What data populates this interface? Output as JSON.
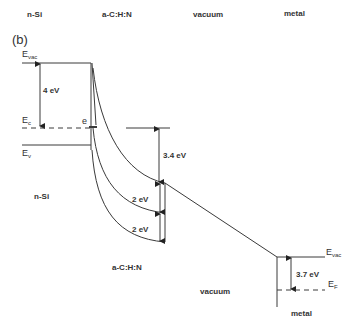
{
  "panel_label": "(b)",
  "regions": {
    "header": [
      "n-Si",
      "a-C:H:N",
      "vacuum",
      "metal"
    ],
    "body": {
      "nsi": "n-Si",
      "acn": "a-C:H:N",
      "vacuum": "vacuum",
      "metal": "metal"
    }
  },
  "levels": {
    "evac_left": {
      "main": "E",
      "sub": "vac"
    },
    "ec": {
      "main": "E",
      "sub": "c"
    },
    "ev": {
      "main": "E",
      "sub": "v"
    },
    "evac_right": {
      "main": "E",
      "sub": "vac"
    },
    "ef": {
      "main": "E",
      "sub": "F"
    }
  },
  "electron_label": "e",
  "energies": {
    "nsi_affinity": "4 eV",
    "acn_offset": "3.4 eV",
    "gap_upper": "2 eV",
    "gap_lower": "2 eV",
    "metal_workfunction": "3.7 eV"
  },
  "colors": {
    "line": "#3a3a3a",
    "text": "#333333",
    "background": "#ffffff"
  }
}
